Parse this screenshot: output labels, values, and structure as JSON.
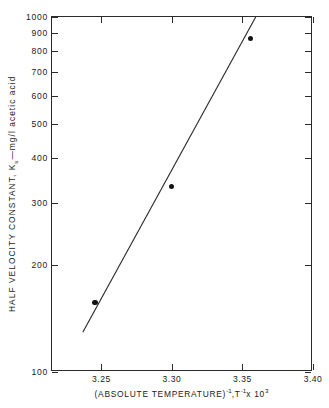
{
  "chart_data": {
    "type": "scatter",
    "title": "",
    "subtitle": "",
    "xlabel_plain": "(ABSOLUTE TEMPERATURE)-1 ,T-1 x 10 3",
    "xlabel_parts": {
      "main": "(ABSOLUTE  TEMPERATURE)",
      "exp1": "-1",
      "mid": ",T",
      "exp2": "-1",
      "times": "x 10",
      "exp3": "3"
    },
    "ylabel_parts": {
      "pre": "HALF VELOCITY CONSTANT, K",
      "sub": "s",
      "post": "—mg/l acetic acid"
    },
    "yscale": "log",
    "xscale": "linear",
    "ylim": [
      100,
      1000
    ],
    "xlim": [
      3.215,
      3.4
    ],
    "grid": false,
    "legend": null,
    "xticks": [
      3.25,
      3.3,
      3.35,
      3.4
    ],
    "xtick_labels": [
      "3.25",
      "3.30",
      "3.35",
      "3.40"
    ],
    "yticks": [
      100,
      200,
      300,
      400,
      500,
      600,
      700,
      800,
      900,
      1000
    ],
    "ytick_labels": [
      "100",
      "200",
      "300",
      "400",
      "500",
      "600",
      "700",
      "800",
      "900",
      "1000"
    ],
    "series": [
      {
        "name": "Half velocity constant data",
        "marker": "filled-circle",
        "x": [
          3.2455,
          3.2995,
          3.3555
        ],
        "y": [
          157,
          333,
          870
        ]
      }
    ],
    "fit_line": {
      "name": "Least-squares fit",
      "x": [
        3.237,
        3.3605
      ],
      "y": [
        128,
        1000
      ]
    },
    "colors": {
      "axis": "#2b2b2b",
      "marker": "#131313",
      "line": "#2b2b2b",
      "background": "#ffffff"
    }
  }
}
